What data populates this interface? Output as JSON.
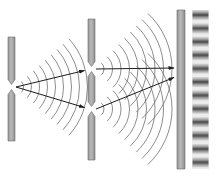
{
  "figure": {
    "name": "double-slit-interference-experiment-diagram",
    "background": "#ffffff",
    "colors": {
      "barrier_fill_left": "#979797",
      "barrier_fill_mid": "#b9b9b9",
      "barrier_fill_right": "#8f8f8f",
      "barrier_edge": "#6a6a6a",
      "wave_arc": "#707070",
      "ray": "#1d1d1d",
      "fringe_strip_bg": "#ececec",
      "fringe_band": "#4f4f4f"
    },
    "barriers": [
      {
        "name": "single-slit-barrier",
        "x": 8,
        "w": 7,
        "top": 37,
        "bottom": 141,
        "taper": 5,
        "slits": [
          {
            "center": 87,
            "gap": 5
          }
        ]
      },
      {
        "name": "double-slit-barrier",
        "x": 88,
        "w": 7,
        "top": 19,
        "bottom": 160,
        "taper": 5,
        "slits": [
          {
            "center": 69,
            "gap": 5
          },
          {
            "center": 109,
            "gap": 5
          }
        ]
      },
      {
        "name": "detection-screen",
        "x": 177,
        "w": 8,
        "top": 10,
        "bottom": 169,
        "taper": 0,
        "slits": []
      }
    ],
    "wavefront_sets": [
      {
        "name": "wavefronts-from-source-slit",
        "cx": 15.5,
        "cy": 87,
        "r0": 8,
        "dr": 8,
        "count": 9,
        "angle_deg": 42
      },
      {
        "name": "wavefronts-from-upper-slit",
        "cx": 96,
        "cy": 69,
        "r0": 8,
        "dr": 8.5,
        "count": 9,
        "angle_deg": 47
      },
      {
        "name": "wavefronts-from-lower-slit",
        "cx": 96,
        "cy": 109,
        "r0": 8,
        "dr": 8.5,
        "count": 9,
        "angle_deg": 47
      }
    ],
    "rays": [
      {
        "name": "ray-source-to-upper-slit",
        "x1": 16,
        "y1": 87,
        "x2": 84.5,
        "y2": 70.5
      },
      {
        "name": "ray-source-to-lower-slit",
        "x1": 16,
        "y1": 87,
        "x2": 84.5,
        "y2": 107.5
      },
      {
        "name": "ray-upper-slit-to-screen",
        "x1": 96,
        "y1": 69,
        "x2": 174,
        "y2": 68
      },
      {
        "name": "ray-lower-slit-to-screen",
        "x1": 96,
        "y1": 109,
        "x2": 174,
        "y2": 77.5
      }
    ],
    "fringe_pattern": {
      "name": "interference-fringe-pattern",
      "x": 192,
      "w": 17,
      "top": 10,
      "bottom": 169,
      "band_count": 12,
      "first_center": 15,
      "period": 13.4,
      "band_height": 11
    }
  }
}
